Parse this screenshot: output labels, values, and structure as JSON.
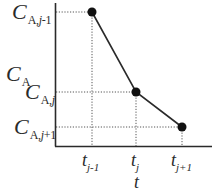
{
  "diagram": {
    "y_axis_title": {
      "main": "C",
      "sub": "A"
    },
    "x_axis_title": "t",
    "y_ticks": [
      {
        "main": "C",
        "sub_prefix": "A,",
        "sub_var": "j",
        "sub_suffix": "-1"
      },
      {
        "main": "C",
        "sub_prefix": "A,",
        "sub_var": "j",
        "sub_suffix": ""
      },
      {
        "main": "C",
        "sub_prefix": "A,",
        "sub_var": "j",
        "sub_suffix": "+1"
      }
    ],
    "x_ticks": [
      {
        "main": "t",
        "sub": "j-1"
      },
      {
        "main": "t",
        "sub": "j"
      },
      {
        "main": "t",
        "sub": "j+1"
      }
    ],
    "points": [
      {
        "name": "point-j-minus-1",
        "x": 92,
        "y": 12
      },
      {
        "name": "point-j",
        "x": 136,
        "y": 92
      },
      {
        "name": "point-j-plus-1",
        "x": 182,
        "y": 127
      }
    ],
    "colors": {
      "axis": "#2a2a2a",
      "line": "#2a2a2a",
      "guide": "#555555",
      "point": "#111111"
    }
  }
}
